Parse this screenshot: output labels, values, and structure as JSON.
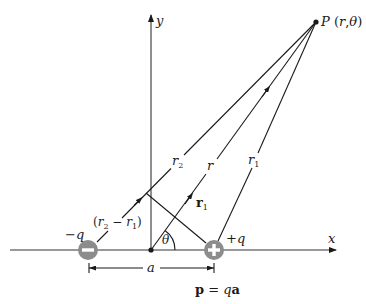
{
  "diagram": {
    "colors": {
      "ink": "#1a1a1a",
      "charge_fill": "#8c8c8c",
      "charge_symbol": "#ffffff"
    },
    "axes": {
      "x_label": "x",
      "y_label": "y",
      "origin": [
        151,
        250
      ],
      "x_end": 336,
      "x_start": 10,
      "y_top": 15,
      "y_bottom": 250
    },
    "point": {
      "label": "P (r,θ)",
      "pos": [
        316,
        22
      ]
    },
    "charges": [
      {
        "id": "negative",
        "label": "−q",
        "symbol": "−",
        "pos": [
          88,
          250
        ],
        "radius": 10
      },
      {
        "id": "positive",
        "label": "+q",
        "symbol": "+",
        "pos": [
          214,
          250
        ],
        "radius": 10
      }
    ],
    "vectors": {
      "r_label": "r",
      "r1_label": "r",
      "r1_sub": "1",
      "r2_label": "r",
      "r2_sub": "2",
      "r1_vec_label": "r",
      "r1_vec_sub": "1",
      "diff_label_open": "(r",
      "diff_sub_2": "2",
      "diff_minus": " − r",
      "diff_sub_1": "1",
      "diff_close": ")"
    },
    "angle_label": "θ",
    "dimension": {
      "label": "a",
      "from": 89,
      "to": 214,
      "y": 268
    },
    "dipole_formula": {
      "p": "p",
      "equals": " = ",
      "q": "q",
      "a": "a"
    }
  }
}
